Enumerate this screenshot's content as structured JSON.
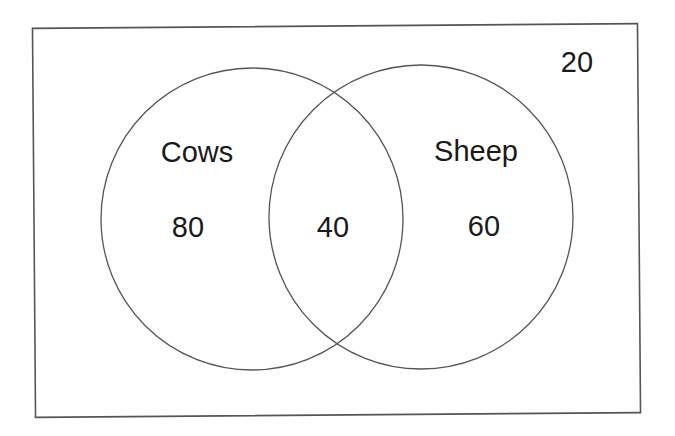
{
  "diagram": {
    "type": "venn",
    "universe": {
      "label": "",
      "outside_count": "20"
    },
    "sets": [
      {
        "name": "Cows",
        "only_count": "80"
      },
      {
        "name": "Sheep",
        "only_count": "60"
      }
    ],
    "intersection": {
      "sets": [
        "Cows",
        "Sheep"
      ],
      "count": "40"
    },
    "colors": {
      "stroke": "#555555",
      "text": "#1a1a1a",
      "background": "#ffffff"
    }
  }
}
